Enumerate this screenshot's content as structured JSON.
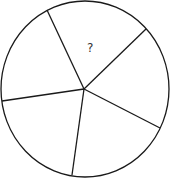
{
  "diagram": {
    "type": "circle-divided-into-sectors",
    "sector_count": 5,
    "stroke_color": "#1a1a1a",
    "background_color": "#ffffff",
    "circle": {
      "cx": 85,
      "cy": 89,
      "rx": 84,
      "ry": 88
    },
    "center": {
      "x": 84,
      "y": 89
    },
    "spokes": [
      {
        "x": 47,
        "y": 10
      },
      {
        "x": 146,
        "y": 29
      },
      {
        "x": 160,
        "y": 128
      },
      {
        "x": 72,
        "y": 175
      },
      {
        "x": 2,
        "y": 101
      }
    ],
    "unknown_sector_label": "?"
  }
}
